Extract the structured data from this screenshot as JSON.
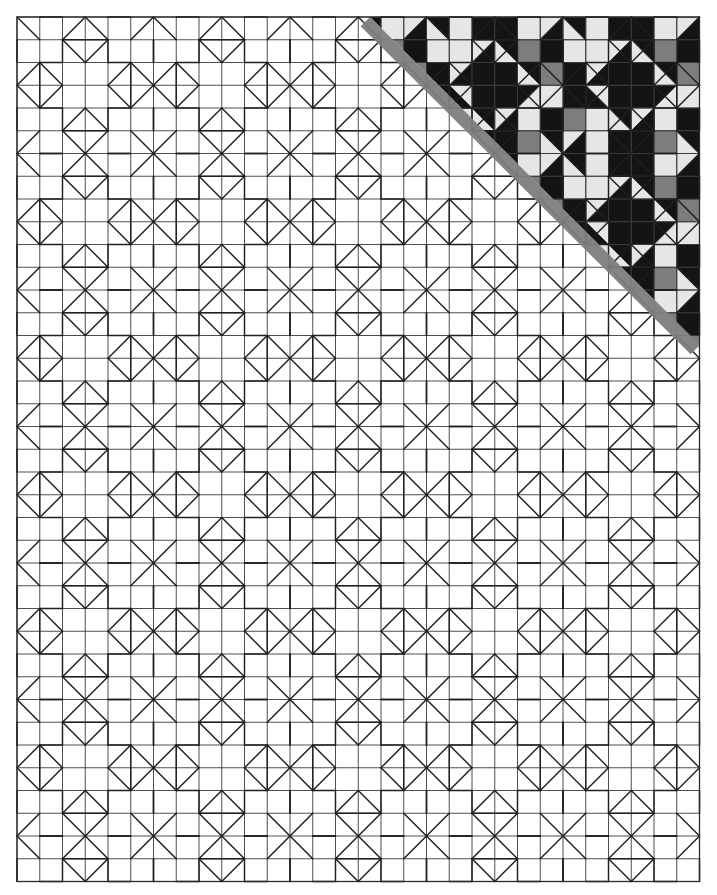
{
  "document": {
    "title": "Quilt Block Pattern Layout Diagram",
    "kind": "line-drawing-diagram"
  },
  "canvas": {
    "width": 717,
    "height": 895,
    "background": "#ffffff"
  },
  "grid": {
    "origin_x": 17,
    "origin_y": 17,
    "cell": 22.75,
    "columns": 30,
    "rows": 38,
    "line_color": "#3a3a3a",
    "line_width": 0.9,
    "outer_line_width": 1.3,
    "visible": true,
    "label": "square patch grid"
  },
  "block": {
    "size_cells": 6,
    "name": "star-cross-block",
    "motif": "eight-point star with hipped octagon corners",
    "motif_line_color": "#1f1f1f",
    "motif_line_width": 1.45,
    "columns_of_blocks": 5,
    "rows_of_blocks": 6.333
  },
  "palette": {
    "dark": "#141414",
    "medium": "#7d7d7d",
    "light": "#e6e6e6",
    "white": "#ffffff",
    "outline": "#2a2a2a",
    "grid": "#3c3c3c",
    "diagonal_shade": "#7d7d7d"
  },
  "coloring": {
    "region": "upper-right triangle",
    "boundary": "anti-diagonal from top-left of coloured area down to right edge",
    "boundary_shade_color": "#7d7d7d",
    "boundary_start": {
      "x": 370,
      "y": 17
    },
    "boundary_end": {
      "x": 700,
      "y": 345
    },
    "description": "Fabric value placement shown on upper-right blocks; remainder left as uncoloured piecing lines."
  },
  "legend": {
    "values": [
      {
        "name": "dark",
        "swatch": "#141414",
        "label": "dark value"
      },
      {
        "name": "medium",
        "swatch": "#7d7d7d",
        "label": "medium value"
      },
      {
        "name": "light",
        "swatch": "#e6e6e6",
        "label": "light value"
      },
      {
        "name": "background",
        "swatch": "#ffffff",
        "label": "background"
      }
    ]
  },
  "chart_data": {
    "type": "heatmap",
    "xlabel": "",
    "ylabel": "",
    "grid": true,
    "legend_position": "none",
    "categories": [
      "dark",
      "medium",
      "light",
      "white"
    ],
    "values": [
      3,
      1,
      3,
      2
    ]
  }
}
